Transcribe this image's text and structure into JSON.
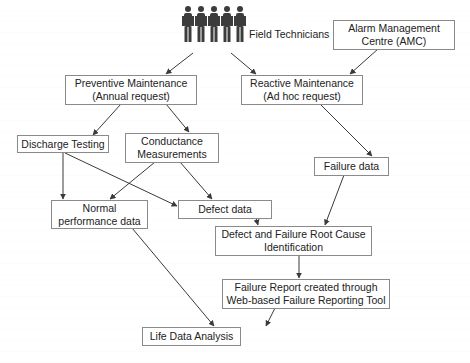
{
  "diagram": {
    "type": "flowchart",
    "colors": {
      "stroke": "#8a8a8a",
      "arrow": "#3a3a3a",
      "text": "#222222",
      "background": "#ffffff",
      "figure": "#3c3c3c"
    },
    "actors": {
      "field_technicians": {
        "label": "Field Technicians",
        "icon": "person-group-icon",
        "count": 5
      }
    },
    "nodes": {
      "amc": {
        "lines": [
          "Alarm Management",
          "Centre (AMC)"
        ]
      },
      "preventive": {
        "lines": [
          "Preventive Maintenance",
          "(Annual request)"
        ]
      },
      "reactive": {
        "lines": [
          "Reactive Maintenance",
          "(Ad hoc request)"
        ]
      },
      "discharge": {
        "lines": [
          "Discharge Testing"
        ]
      },
      "conductance": {
        "lines": [
          "Conductance",
          "Measurements"
        ]
      },
      "failure_data": {
        "lines": [
          "Failure data"
        ]
      },
      "normal_perf": {
        "lines": [
          "Normal",
          "performance data"
        ]
      },
      "defect_data": {
        "lines": [
          "Defect data"
        ]
      },
      "root_cause": {
        "lines": [
          "Defect and Failure Root Cause",
          "Identification"
        ]
      },
      "failure_report": {
        "lines": [
          "Failure Report created through",
          "Web-based Failure Reporting Tool"
        ]
      },
      "life_data": {
        "lines": [
          "Life Data Analysis"
        ]
      }
    },
    "edges": [
      {
        "from": "field_technicians",
        "to": "preventive"
      },
      {
        "from": "field_technicians",
        "to": "reactive"
      },
      {
        "from": "amc",
        "to": "reactive"
      },
      {
        "from": "preventive",
        "to": "discharge"
      },
      {
        "from": "preventive",
        "to": "conductance"
      },
      {
        "from": "reactive",
        "to": "failure_data"
      },
      {
        "from": "discharge",
        "to": "normal_perf"
      },
      {
        "from": "discharge",
        "to": "defect_data"
      },
      {
        "from": "conductance",
        "to": "normal_perf"
      },
      {
        "from": "conductance",
        "to": "defect_data"
      },
      {
        "from": "defect_data",
        "to": "root_cause"
      },
      {
        "from": "failure_data",
        "to": "root_cause"
      },
      {
        "from": "root_cause",
        "to": "failure_report"
      },
      {
        "from": "normal_perf",
        "to": "life_data"
      },
      {
        "from": "failure_report",
        "to": "life_data"
      }
    ]
  }
}
